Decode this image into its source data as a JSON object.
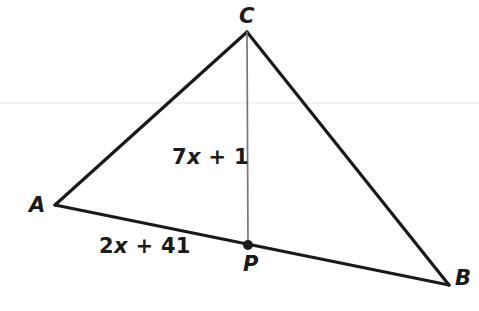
{
  "figure": {
    "type": "geometry-diagram",
    "shape": "triangle-with-cevian",
    "canvas": {
      "width": 479,
      "height": 311
    },
    "background_color": "#ffffff",
    "stroke_color": "#1a1a1a",
    "cevian_color": "#777777",
    "artifact_line_color": "#f2f2f2",
    "vertices": [
      {
        "name": "C",
        "label": "C",
        "x": 247,
        "y": 32
      },
      {
        "name": "A",
        "label": "A",
        "x": 55,
        "y": 205
      },
      {
        "name": "B",
        "label": "B",
        "x": 449,
        "y": 285
      }
    ],
    "points": [
      {
        "name": "P",
        "label": "P",
        "x": 248,
        "y": 245,
        "on_segment": "AB",
        "marker": "filled-dot",
        "radius": 5
      }
    ],
    "segments": [
      {
        "name": "AC",
        "from": "A",
        "to": "C",
        "style": "solid-black",
        "width": 3
      },
      {
        "name": "CB",
        "from": "C",
        "to": "B",
        "style": "solid-black",
        "width": 3
      },
      {
        "name": "AB",
        "from": "A",
        "to": "B",
        "style": "solid-black",
        "width": 3
      },
      {
        "name": "CP",
        "from": "C",
        "to": "P",
        "style": "solid-gray",
        "width": 1.6
      }
    ],
    "measure_labels": {
      "cevian": {
        "for": "CP",
        "prefix": "7",
        "variable": "x",
        "suffix": " + 1",
        "text": "7x + 1"
      },
      "base": {
        "for": "AP",
        "prefix": "2",
        "variable": "x",
        "suffix": " + 41",
        "text": "2x + 41"
      }
    }
  }
}
